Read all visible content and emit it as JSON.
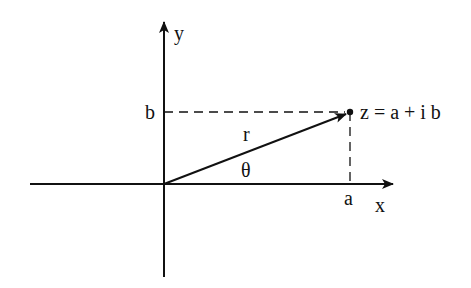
{
  "diagram": {
    "labels": {
      "y_axis": "y",
      "x_axis": "x",
      "b": "b",
      "a": "a",
      "r": "r",
      "theta": "θ",
      "point": "z = a + i b"
    },
    "colors": {
      "stroke": "#111111",
      "background": "#ffffff"
    }
  }
}
